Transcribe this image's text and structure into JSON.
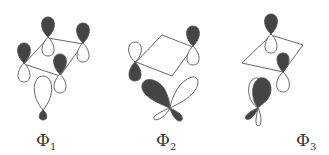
{
  "figure": {
    "panels": [
      {
        "label_symbol": "Φ",
        "label_subscript": "1",
        "description": "four p-orbitals on a square plus a p-orbital below"
      },
      {
        "label_symbol": "Φ",
        "label_subscript": "2",
        "description": "two p-orbitals on square corners plus hybrid orbital below"
      },
      {
        "label_symbol": "Φ",
        "label_subscript": "3",
        "description": "two p-orbitals on square corners plus tilted orbital below"
      }
    ],
    "colors": {
      "filled_lobe": "#444444",
      "outline": "#555555",
      "background": "#ffffff"
    }
  }
}
